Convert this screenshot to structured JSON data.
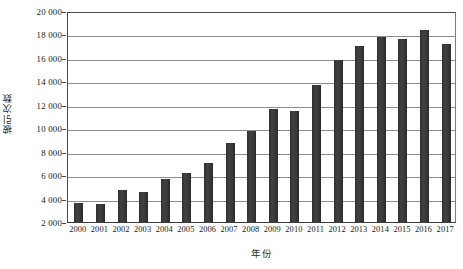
{
  "chart_data": {
    "type": "bar",
    "title": "",
    "xlabel": "年份",
    "ylabel": "被引次数",
    "categories": [
      "2000",
      "2001",
      "2002",
      "2003",
      "2004",
      "2005",
      "2006",
      "2007",
      "2008",
      "2009",
      "2010",
      "2011",
      "2012",
      "2013",
      "2014",
      "2015",
      "2016",
      "2017"
    ],
    "values": [
      3600,
      3500,
      4700,
      4550,
      5700,
      6150,
      7000,
      8750,
      9800,
      11600,
      11500,
      13650,
      15800,
      17000,
      17800,
      17650,
      18350,
      17200
    ],
    "ylim": [
      2000,
      20000
    ],
    "y_ticks": [
      2000,
      4000,
      6000,
      8000,
      10000,
      12000,
      14000,
      16000,
      18000,
      20000
    ],
    "y_tick_labels": [
      "2 000",
      "4 000",
      "6 000",
      "8 000",
      "10 000",
      "12 000",
      "14 000",
      "16 000",
      "18 000",
      "20 000"
    ],
    "grid": true,
    "legend": "none",
    "bar_color": "#383838",
    "grid_color": "#8d8d8d",
    "axis_color": "#4a4a4a",
    "background_color": "#ffffff"
  }
}
